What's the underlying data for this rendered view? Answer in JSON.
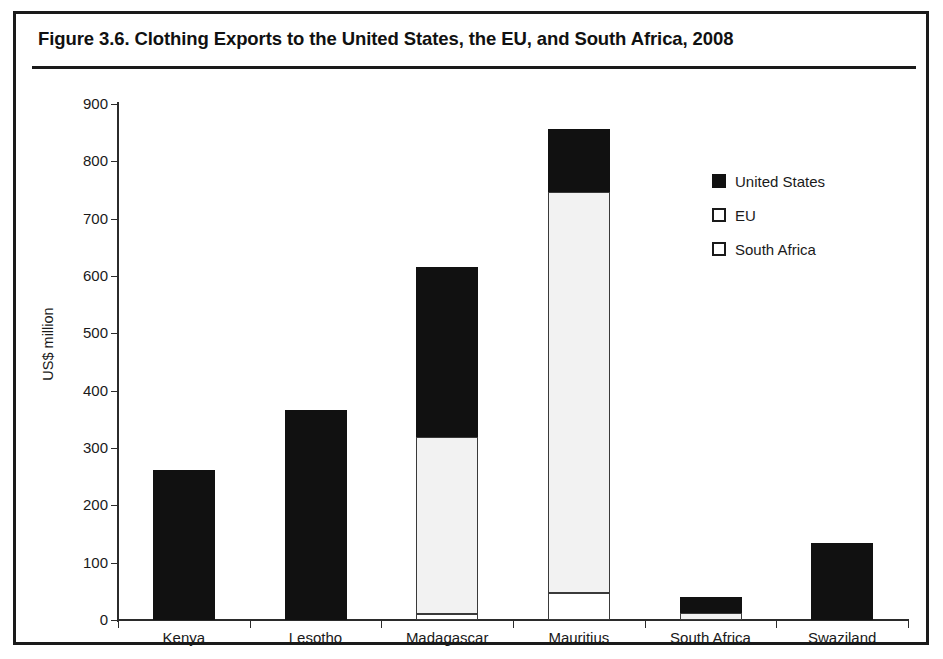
{
  "figure": {
    "title": "Figure 3.6. Clothing Exports to the United States, the EU, and South Africa, 2008"
  },
  "chart_data": {
    "type": "bar",
    "stacked": true,
    "title": "Figure 3.6. Clothing Exports to the United States, the EU, and South Africa, 2008",
    "xlabel": "",
    "ylabel": "US$ million",
    "ylim": [
      0,
      900
    ],
    "ytick_step": 100,
    "yticks": [
      0,
      100,
      200,
      300,
      400,
      500,
      600,
      700,
      800,
      900
    ],
    "ytick_labels": [
      "0",
      "100",
      "200",
      "300",
      "400",
      "500",
      "600",
      "700",
      "800",
      "900"
    ],
    "grid": false,
    "legend_position": "right",
    "categories": [
      "Kenya",
      "Lesotho",
      "Madagascar",
      "Mauritius",
      "South Africa",
      "Swaziland"
    ],
    "series": [
      {
        "name": "United States",
        "color": "#111111",
        "values": [
          262,
          366,
          295,
          110,
          27,
          134
        ]
      },
      {
        "name": "EU",
        "color": "#f2f2f2",
        "values": [
          0,
          0,
          310,
          700,
          13,
          0
        ]
      },
      {
        "name": "South Africa",
        "color": "#ffffff",
        "values": [
          0,
          0,
          10,
          47,
          0,
          0
        ]
      }
    ],
    "totals": [
      262,
      366,
      615,
      857,
      40,
      134
    ]
  },
  "legend": {
    "items": [
      {
        "label": "United States",
        "swatch": "filled-black-square"
      },
      {
        "label": "EU",
        "swatch": "outlined-white-square"
      },
      {
        "label": "South Africa",
        "swatch": "outlined-white-square"
      }
    ]
  }
}
